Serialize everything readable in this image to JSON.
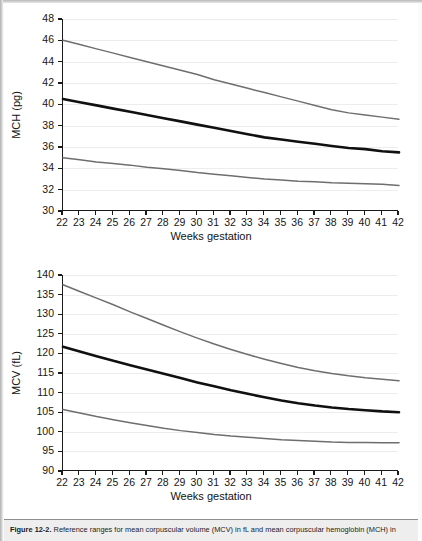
{
  "figure": {
    "caption_label": "Figure 12-2.",
    "caption_body": "Reference ranges for mean corpuscular volume (MCV) in fL and mean corpuscular hemoglobin (MCH) in"
  },
  "chart_data": [
    {
      "id": "mch",
      "type": "line",
      "title": "",
      "xlabel": "Weeks gestation",
      "ylabel": "MCH (pg)",
      "xlim": [
        22,
        42
      ],
      "ylim": [
        30,
        48
      ],
      "yticks": [
        30,
        32,
        34,
        36,
        38,
        40,
        42,
        44,
        46,
        48
      ],
      "xticks": [
        22,
        23,
        24,
        25,
        26,
        27,
        28,
        29,
        30,
        31,
        32,
        33,
        34,
        35,
        36,
        37,
        38,
        39,
        40,
        41,
        42
      ],
      "grid": true,
      "legend": "none",
      "x": [
        22,
        23,
        24,
        25,
        26,
        27,
        28,
        29,
        30,
        31,
        32,
        33,
        34,
        35,
        36,
        37,
        38,
        39,
        40,
        41,
        42
      ],
      "series": [
        {
          "name": "upper reference limit",
          "color": "#6e6e6e",
          "width": 1.5,
          "values": [
            46.0,
            45.6,
            45.2,
            44.8,
            44.4,
            44.0,
            43.6,
            43.2,
            42.8,
            42.3,
            41.9,
            41.5,
            41.1,
            40.7,
            40.3,
            39.9,
            39.5,
            39.2,
            39.0,
            38.8,
            38.6
          ]
        },
        {
          "name": "mean",
          "color": "#101010",
          "width": 2.6,
          "values": [
            40.5,
            40.2,
            39.9,
            39.6,
            39.3,
            39.0,
            38.7,
            38.4,
            38.1,
            37.8,
            37.5,
            37.2,
            36.9,
            36.7,
            36.5,
            36.3,
            36.1,
            35.9,
            35.8,
            35.6,
            35.5
          ]
        },
        {
          "name": "lower reference limit",
          "color": "#6e6e6e",
          "width": 1.5,
          "values": [
            35.0,
            34.8,
            34.6,
            34.45,
            34.3,
            34.1,
            33.95,
            33.8,
            33.6,
            33.45,
            33.3,
            33.15,
            33.0,
            32.9,
            32.8,
            32.75,
            32.65,
            32.6,
            32.55,
            32.5,
            32.4
          ]
        }
      ]
    },
    {
      "id": "mcv",
      "type": "line",
      "title": "",
      "xlabel": "Weeks gestation",
      "ylabel": "MCV (fL)",
      "xlim": [
        22,
        42
      ],
      "ylim": [
        90,
        140
      ],
      "yticks": [
        90,
        95,
        100,
        105,
        110,
        115,
        120,
        125,
        130,
        135,
        140
      ],
      "xticks": [
        22,
        23,
        24,
        25,
        26,
        27,
        28,
        29,
        30,
        31,
        32,
        33,
        34,
        35,
        36,
        37,
        38,
        39,
        40,
        41,
        42
      ],
      "grid": true,
      "legend": "none",
      "x": [
        22,
        23,
        24,
        25,
        26,
        27,
        28,
        29,
        30,
        31,
        32,
        33,
        34,
        35,
        36,
        37,
        38,
        39,
        40,
        41,
        42
      ],
      "series": [
        {
          "name": "upper reference limit",
          "color": "#6e6e6e",
          "width": 1.5,
          "values": [
            137.5,
            135.8,
            134.1,
            132.4,
            130.6,
            128.9,
            127.2,
            125.5,
            123.9,
            122.4,
            121.0,
            119.7,
            118.5,
            117.4,
            116.4,
            115.6,
            114.9,
            114.3,
            113.8,
            113.4,
            113.0
          ]
        },
        {
          "name": "mean",
          "color": "#101010",
          "width": 2.6,
          "values": [
            121.7,
            120.5,
            119.3,
            118.1,
            117.0,
            115.9,
            114.8,
            113.7,
            112.6,
            111.6,
            110.6,
            109.7,
            108.8,
            108.0,
            107.3,
            106.7,
            106.2,
            105.8,
            105.5,
            105.2,
            105.0
          ]
        },
        {
          "name": "lower reference limit",
          "color": "#6e6e6e",
          "width": 1.5,
          "values": [
            105.7,
            104.8,
            103.9,
            103.1,
            102.3,
            101.6,
            100.9,
            100.3,
            99.8,
            99.3,
            98.9,
            98.6,
            98.3,
            98.0,
            97.8,
            97.6,
            97.4,
            97.3,
            97.25,
            97.2,
            97.2
          ]
        }
      ]
    }
  ]
}
